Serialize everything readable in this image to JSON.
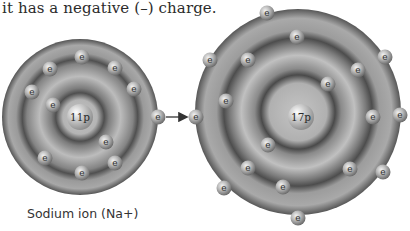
{
  "caption": {
    "top_text": "it has a negative (–) charge."
  },
  "sodium": {
    "label": "Sodium ion (Na+)",
    "nucleus_label": "11p",
    "center": [
      80,
      117
    ],
    "radius": 78,
    "electron_label": "e",
    "shells": [
      {
        "name": "K",
        "electrons": [
          [
            53,
            105
          ],
          [
            106,
            142
          ]
        ]
      },
      {
        "name": "L",
        "electrons": [
          [
            82,
            57
          ],
          [
            50,
            69
          ],
          [
            115,
            68
          ],
          [
            32,
            92
          ],
          [
            134,
            89
          ],
          [
            45,
            158
          ],
          [
            82,
            173
          ],
          [
            115,
            163
          ]
        ]
      }
    ],
    "transferring_electron": [
      158,
      117
    ]
  },
  "chlorine": {
    "nucleus_label": "17p",
    "center": [
      298,
      117
    ],
    "radius": 103,
    "electron_label": "e",
    "shells": [
      {
        "name": "K",
        "electrons": [
          [
            328,
            84
          ],
          [
            268,
            145
          ]
        ]
      },
      {
        "name": "L",
        "electrons": [
          [
            297,
            37
          ],
          [
            248,
            60
          ],
          [
            358,
            70
          ],
          [
            226,
            101
          ],
          [
            373,
            117
          ],
          [
            248,
            168
          ],
          [
            350,
            169
          ],
          [
            283,
            187
          ]
        ]
      },
      {
        "name": "M",
        "electrons": [
          [
            267,
            13
          ],
          [
            210,
            60
          ],
          [
            385,
            57
          ],
          [
            196,
            117
          ],
          [
            400,
            115
          ],
          [
            383,
            172
          ],
          [
            224,
            188
          ],
          [
            298,
            218
          ]
        ]
      }
    ]
  },
  "arrow": {
    "from": [
      166,
      117
    ],
    "to": [
      188,
      117
    ],
    "color": "#333333"
  },
  "colors": {
    "shell_light": "#b5b5b5",
    "shell_mid": "#8f8f8f",
    "shell_dark": "#5a5a5a",
    "electron": "#bdbdbd",
    "nucleus": "#c6c6c6"
  }
}
